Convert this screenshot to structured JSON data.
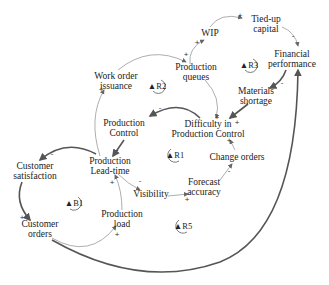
{
  "diagram": {
    "type": "causal-loop-diagram",
    "nodes": [
      {
        "id": "tied_up_capital",
        "label": "Tied-up\ncapital",
        "x": 266,
        "y": 24
      },
      {
        "id": "wip",
        "label": "WIP",
        "x": 210,
        "y": 33
      },
      {
        "id": "financial_performance",
        "label": "Financial\nperformance",
        "x": 292,
        "y": 59
      },
      {
        "id": "production_queues",
        "label": "Production\nqueues",
        "x": 196,
        "y": 72
      },
      {
        "id": "work_order_issuance",
        "label": "Work order\nissuance",
        "x": 116,
        "y": 81
      },
      {
        "id": "materials_shortage",
        "label": "Materials\nshortage",
        "x": 256,
        "y": 96
      },
      {
        "id": "production_control",
        "label": "Production\nControl",
        "x": 124,
        "y": 128
      },
      {
        "id": "difficulty_in_pc",
        "label": "Difficulty in\nProduction Control",
        "x": 208,
        "y": 129
      },
      {
        "id": "change_orders",
        "label": "Change orders",
        "x": 237,
        "y": 157
      },
      {
        "id": "production_lead_time",
        "label": "Production\nLead-time",
        "x": 110,
        "y": 166
      },
      {
        "id": "customer_satisfaction",
        "label": "Customer\nsatisfaction",
        "x": 35,
        "y": 171
      },
      {
        "id": "forecast_accuracy",
        "label": "Forecast\naccuracy",
        "x": 204,
        "y": 187
      },
      {
        "id": "visibility",
        "label": "Visibility",
        "x": 151,
        "y": 194
      },
      {
        "id": "production_load",
        "label": "Production\nload",
        "x": 122,
        "y": 219
      },
      {
        "id": "customer_orders",
        "label": "Customer\norders",
        "x": 40,
        "y": 229
      }
    ],
    "loops": [
      {
        "id": "R2",
        "label": "R2",
        "x": 157,
        "y": 86
      },
      {
        "id": "R3",
        "label": "R3",
        "x": 249,
        "y": 65
      },
      {
        "id": "R1",
        "label": "R1",
        "x": 175,
        "y": 155
      },
      {
        "id": "B1",
        "label": "B1",
        "x": 74,
        "y": 203
      },
      {
        "id": "R5",
        "label": "R5",
        "x": 183,
        "y": 226
      }
    ],
    "signs": [
      {
        "text": "+",
        "x": 240,
        "y": 15
      },
      {
        "text": "-",
        "x": 293,
        "y": 35
      },
      {
        "text": "+",
        "x": 197,
        "y": 42
      },
      {
        "text": "+",
        "x": 186,
        "y": 54
      },
      {
        "text": "-",
        "x": 282,
        "y": 82
      },
      {
        "text": "+",
        "x": 101,
        "y": 89
      },
      {
        "text": "+",
        "x": 217,
        "y": 117
      },
      {
        "text": "+",
        "x": 237,
        "y": 122
      },
      {
        "text": "-",
        "x": 160,
        "y": 107
      },
      {
        "text": "-",
        "x": 117,
        "y": 149
      },
      {
        "text": "+",
        "x": 229,
        "y": 140
      },
      {
        "text": "-",
        "x": 52,
        "y": 153
      },
      {
        "text": "-",
        "x": 229,
        "y": 170
      },
      {
        "text": "-",
        "x": 140,
        "y": 180
      },
      {
        "text": "+",
        "x": 112,
        "y": 182
      },
      {
        "text": "+",
        "x": 187,
        "y": 199
      },
      {
        "text": "+",
        "x": 22,
        "y": 217
      },
      {
        "text": "+",
        "x": 117,
        "y": 234
      }
    ]
  }
}
